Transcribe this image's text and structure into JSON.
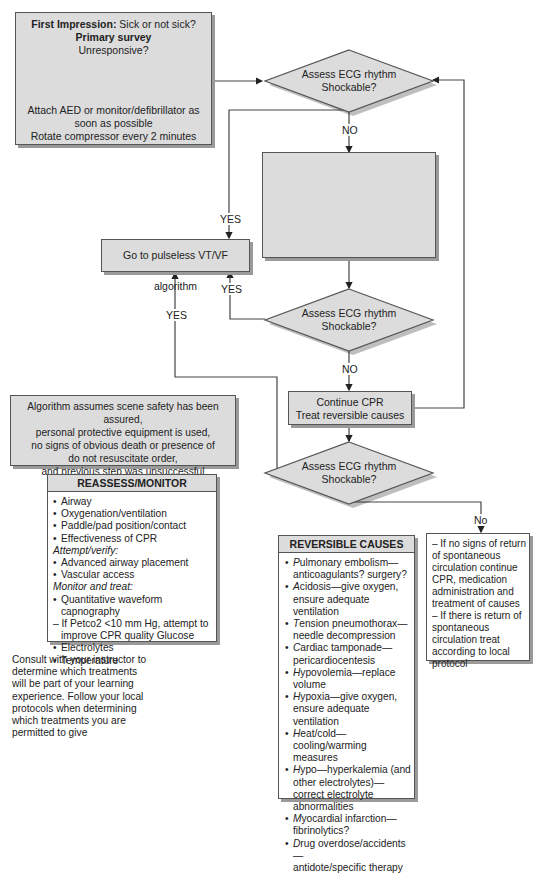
{
  "start_box": {
    "title_bold": "First Impression:",
    "title_rest": " Sick or not sick?",
    "line2": "Primary survey",
    "line3": "Unresponsive?",
    "line4": "Attach AED or monitor/defibrillator as",
    "line5": "soon as possible",
    "line6": "Rotate compressor every 2 minutes"
  },
  "decisions": [
    {
      "line1": "Assess ECG rhythm",
      "line2": "Shockable?"
    },
    {
      "line1": "Assess ECG rhythm",
      "line2": "Shockable?"
    },
    {
      "line1": "Assess ECG rhythm",
      "line2": "Shockable?"
    }
  ],
  "empty_box": {
    "text": ""
  },
  "pulseless_box": {
    "label": "Go to pulseless VT/VF algorithm"
  },
  "continue_box": {
    "line1": "Continue CPR",
    "line2": "Treat reversible causes"
  },
  "edge_labels": {
    "no1": "NO",
    "yes1": "YES",
    "yes2": "YES",
    "yes3": "YES",
    "no2": "NO",
    "no3": "No"
  },
  "assumption_box": {
    "lines": [
      "Algorithm assumes scene safety has been assured,",
      "personal protective equipment is used,",
      "no signs of obvious death or presence of",
      "do not resuscitate order,",
      "and previous step was unsuccessful"
    ]
  },
  "reassess_box": {
    "header": "REASSESS/MONITOR",
    "items": [
      {
        "type": "b",
        "text": "Airway"
      },
      {
        "type": "b",
        "text": "Oxygenation/ventilation"
      },
      {
        "type": "b",
        "text": "Paddle/pad position/contact"
      },
      {
        "type": "b",
        "text": "Effectiveness of CPR"
      },
      {
        "type": "h",
        "text": "Attempt/verify:"
      },
      {
        "type": "b",
        "text": "Advanced airway placement"
      },
      {
        "type": "b",
        "text": "Vascular access"
      },
      {
        "type": "h",
        "text": "Monitor and treat:"
      },
      {
        "type": "b",
        "text": "Quantitative waveform capnography"
      },
      {
        "type": "d",
        "text": "– If Petco2 <10 mm Hg, attempt to"
      },
      {
        "type": "sub",
        "text": "improve CPR quality Glucose"
      },
      {
        "type": "b",
        "text": "Electrolytes"
      },
      {
        "type": "b",
        "text": "Temperature"
      }
    ]
  },
  "consult_note": {
    "text": "Consult with your instructor to determine which treatments will be part of your learning experience. Follow your local protocols when determining which treatments you are permitted to give"
  },
  "reversible_box": {
    "header": "REVERSIBLE CAUSES",
    "items": [
      {
        "initial": "P",
        "rest": "ulmonary embolism—",
        "cont": "anticoagulants? surgery?"
      },
      {
        "initial": "A",
        "rest": "cidosis—give oxygen,",
        "cont": "ensure adequate ventilation"
      },
      {
        "initial": "T",
        "rest": "ension pneumothorax—",
        "cont": "needle decompression"
      },
      {
        "initial": "C",
        "rest": "ardiac tamponade—",
        "cont": "pericardiocentesis"
      },
      {
        "initial": "H",
        "rest": "ypovolemia—replace",
        "cont": "volume"
      },
      {
        "initial": "H",
        "rest": "ypoxia—give oxygen,",
        "cont": "ensure adequate ventilation"
      },
      {
        "initial": "H",
        "rest": "eat/cold—cooling/warming",
        "cont": "measures"
      },
      {
        "initial": "H",
        "rest": "ypo—hyperkalemia (and",
        "cont": "other electrolytes)—correct electrolyte abnormalities"
      },
      {
        "initial": "M",
        "rest": "yocardial infarction—",
        "cont": "fibrinolytics?"
      },
      {
        "initial": "D",
        "rest": "rug overdose/accidents—",
        "cont": "antidote/specific therapy"
      }
    ]
  },
  "outcome_box": {
    "text1": "– If no signs of return of spontaneous circulation continue CPR, medication administration and treatment of causes",
    "text2": "– If there is return of spontaneous circulation treat according to local protocol"
  }
}
